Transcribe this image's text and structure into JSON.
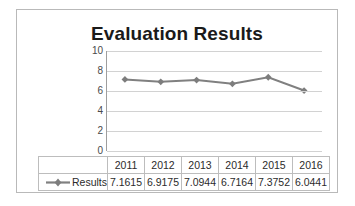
{
  "chart_data": {
    "type": "line",
    "title": "Evaluation Results",
    "xlabel": "",
    "ylabel": "",
    "categories": [
      "2011",
      "2012",
      "2013",
      "2014",
      "2015",
      "2016"
    ],
    "series": [
      {
        "name": "Results",
        "values": [
          7.1615,
          6.9175,
          7.0944,
          6.7164,
          7.3752,
          6.0441
        ]
      }
    ],
    "ylim": [
      0,
      10
    ],
    "yticks": [
      "10",
      "8",
      "6",
      "4",
      "2",
      "0"
    ],
    "grid": true,
    "legend_position": "data-table",
    "marker": "diamond",
    "series_color": "#808080",
    "gridline_color": "#d2d2d2"
  },
  "table": {
    "legend_label": "Results",
    "year_header": [
      "2011",
      "2012",
      "2013",
      "2014",
      "2015",
      "2016"
    ],
    "value_row": [
      "7.1615",
      "6.9175",
      "7.0944",
      "6.7164",
      "7.3752",
      "6.0441"
    ]
  }
}
